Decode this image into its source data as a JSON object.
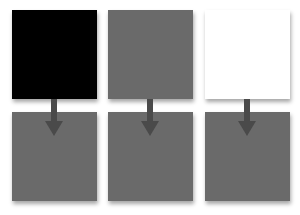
{
  "diagram": {
    "top_row": [
      {
        "label": "",
        "color": "#000000"
      },
      {
        "label": "",
        "color": "#6a6a6a"
      },
      {
        "label": "",
        "color": "#ffffff"
      }
    ],
    "bottom_row": [
      {
        "label": "",
        "color": "#6a6a6a"
      },
      {
        "label": "",
        "color": "#6a6a6a"
      },
      {
        "label": "",
        "color": "#6a6a6a"
      }
    ],
    "arrow_color": "#4a4a4a",
    "arrows": [
      "down",
      "down",
      "down"
    ]
  }
}
